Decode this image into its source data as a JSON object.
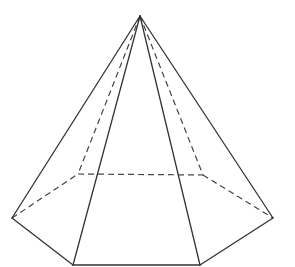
{
  "diagram": {
    "title": "",
    "shape": "hexagonal pyramid",
    "colors": {
      "stroke": "#333333",
      "background": "#ffffff"
    },
    "vertices": {
      "apex": [
        140,
        16
      ],
      "left": [
        12,
        218
      ],
      "front_left": [
        73,
        265
      ],
      "front_right": [
        200,
        265
      ],
      "right": [
        273,
        218
      ],
      "back_right": [
        203,
        175
      ],
      "back_left": [
        78,
        174
      ]
    },
    "visible_edges": [
      [
        "apex",
        "left"
      ],
      [
        "apex",
        "front_left"
      ],
      [
        "apex",
        "front_right"
      ],
      [
        "apex",
        "right"
      ],
      [
        "left",
        "front_left"
      ],
      [
        "front_left",
        "front_right"
      ],
      [
        "front_right",
        "right"
      ]
    ],
    "hidden_edges": [
      [
        "apex",
        "back_left"
      ],
      [
        "apex",
        "back_right"
      ],
      [
        "left",
        "back_left"
      ],
      [
        "back_left",
        "back_right"
      ],
      [
        "back_right",
        "right"
      ]
    ]
  }
}
